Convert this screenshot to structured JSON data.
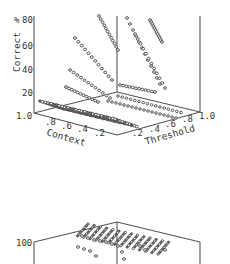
{
  "chart_data": [
    {
      "type": "scatter",
      "subtype": "3d-scatter",
      "title": "",
      "zlabel": "% Correct",
      "xlabel": "Context",
      "ylabel": "Threshold",
      "z_ticks": [
        "20",
        "40",
        "60",
        "80"
      ],
      "z_prefix": "%",
      "corner_label": "1.0",
      "context_ticks": [
        ".8",
        ".6",
        ".4",
        ".2"
      ],
      "threshold_ticks": [
        ".2",
        ".4",
        ".6",
        ".8",
        "1.0"
      ],
      "context_range": [
        1.0,
        0.0
      ],
      "threshold_range": [
        0.0,
        1.0
      ],
      "zlim": [
        0,
        90
      ],
      "grid": false,
      "description": "Dense cluster of points near % Correct ≈ 0–10 across high Context / low-to-mid Threshold, with diagonal streaks of points rising toward 80+ % Correct at low Context / higher Threshold.",
      "series": [
        {
          "name": "floor-cluster",
          "approx_z": 5,
          "context_span": [
            0.2,
            1.0
          ],
          "threshold_span": [
            0.0,
            0.6
          ]
        },
        {
          "name": "rising-streaks",
          "approx_points": [
            {
              "context": 0.6,
              "threshold": 0.2,
              "z": 25
            },
            {
              "context": 0.5,
              "threshold": 0.3,
              "z": 45
            },
            {
              "context": 0.4,
              "threshold": 0.4,
              "z": 65
            },
            {
              "context": 0.3,
              "threshold": 0.5,
              "z": 80
            },
            {
              "context": 0.2,
              "threshold": 0.7,
              "z": 90
            }
          ]
        }
      ]
    },
    {
      "type": "scatter",
      "subtype": "3d-scatter (cropped)",
      "z_ticks": [
        "100"
      ],
      "description": "Second 3D plot, mostly cropped; dense point surface near 100 with a few points descending below."
    }
  ]
}
